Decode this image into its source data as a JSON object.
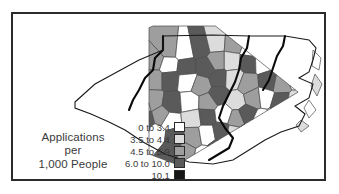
{
  "figure": {
    "type": "choropleth-map",
    "region": "North Carolina",
    "frame_color": "#2b2b2b",
    "background": "#ffffff"
  },
  "legend": {
    "title_lines": [
      "Applications",
      "per",
      "1,000 People"
    ],
    "classes": [
      {
        "label": "0 to 3.4",
        "color": "#ffffff"
      },
      {
        "label": "3.5 to 4.4",
        "color": "#dcdcdc"
      },
      {
        "label": "4.5 to 5.9",
        "color": "#9e9e9e"
      },
      {
        "label": "6.0 to 10.0",
        "color": "#5a5a5a"
      },
      {
        "label": "10.1",
        "color": "#161616"
      }
    ]
  },
  "chart_data": {
    "type": "heatmap",
    "title": "Applications per 1,000 People",
    "xlabel": "",
    "ylabel": "",
    "legend_position": "inset-bottom-left",
    "grid": false,
    "classes": [
      "0 to 3.4",
      "3.5 to 4.4",
      "4.5 to 5.9",
      "6.0 to 10.0",
      "10.1"
    ],
    "class_colors": [
      "#ffffff",
      "#dcdcdc",
      "#9e9e9e",
      "#5a5a5a",
      "#161616"
    ],
    "regions": [
      {
        "id": "w01",
        "class": 2
      },
      {
        "id": "w02",
        "class": 0
      },
      {
        "id": "w03",
        "class": 3
      },
      {
        "id": "w04",
        "class": 1
      },
      {
        "id": "w05",
        "class": 2
      },
      {
        "id": "w06",
        "class": 0
      },
      {
        "id": "w07",
        "class": 3
      },
      {
        "id": "w08",
        "class": 2
      },
      {
        "id": "w09",
        "class": 0
      },
      {
        "id": "w10",
        "class": 3
      },
      {
        "id": "w11",
        "class": 1
      },
      {
        "id": "w12",
        "class": 3
      },
      {
        "id": "w13",
        "class": 2
      },
      {
        "id": "w14",
        "class": 0
      },
      {
        "id": "w15",
        "class": 3
      },
      {
        "id": "w16",
        "class": 3
      },
      {
        "id": "w17",
        "class": 2
      },
      {
        "id": "w18",
        "class": 1
      },
      {
        "id": "w19",
        "class": 3
      },
      {
        "id": "w20",
        "class": 0
      },
      {
        "id": "c01",
        "class": 3
      },
      {
        "id": "c02",
        "class": 4
      },
      {
        "id": "c03",
        "class": 2
      },
      {
        "id": "c04",
        "class": 3
      },
      {
        "id": "c05",
        "class": 1
      },
      {
        "id": "c06",
        "class": 2
      },
      {
        "id": "c07",
        "class": 3
      },
      {
        "id": "c08",
        "class": 0
      },
      {
        "id": "c09",
        "class": 2
      },
      {
        "id": "c10",
        "class": 3
      },
      {
        "id": "c11",
        "class": 1
      },
      {
        "id": "c12",
        "class": 2
      },
      {
        "id": "c13",
        "class": 3
      },
      {
        "id": "c14",
        "class": 2
      },
      {
        "id": "c15",
        "class": 0
      },
      {
        "id": "c16",
        "class": 1
      },
      {
        "id": "c17",
        "class": 3
      },
      {
        "id": "c18",
        "class": 2
      },
      {
        "id": "c19",
        "class": 3
      },
      {
        "id": "c20",
        "class": 1
      },
      {
        "id": "c21",
        "class": 2
      },
      {
        "id": "c22",
        "class": 3
      },
      {
        "id": "c23",
        "class": 0
      },
      {
        "id": "c24",
        "class": 2
      },
      {
        "id": "c25",
        "class": 3
      },
      {
        "id": "c26",
        "class": 1
      },
      {
        "id": "e01",
        "class": 2
      },
      {
        "id": "e02",
        "class": 0
      },
      {
        "id": "e03",
        "class": 3
      },
      {
        "id": "e04",
        "class": 1
      },
      {
        "id": "e05",
        "class": 2
      },
      {
        "id": "e06",
        "class": 0
      },
      {
        "id": "e07",
        "class": 3
      },
      {
        "id": "e08",
        "class": 2
      },
      {
        "id": "e09",
        "class": 0
      },
      {
        "id": "e10",
        "class": 1
      },
      {
        "id": "e11",
        "class": 3
      },
      {
        "id": "e12",
        "class": 0
      },
      {
        "id": "e13",
        "class": 2
      },
      {
        "id": "e14",
        "class": 3
      },
      {
        "id": "e15",
        "class": 0
      },
      {
        "id": "e16",
        "class": 1
      },
      {
        "id": "e17",
        "class": 3
      },
      {
        "id": "e18",
        "class": 2
      },
      {
        "id": "e19",
        "class": 0
      },
      {
        "id": "e20",
        "class": 3
      }
    ]
  }
}
